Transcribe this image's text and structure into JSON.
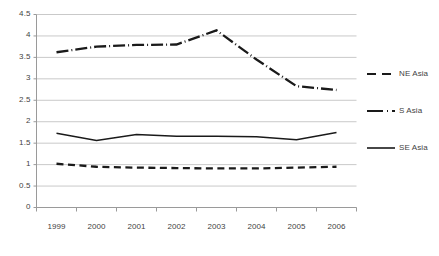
{
  "chart_data": {
    "type": "line",
    "title": "",
    "subtitle": "",
    "xlabel": "",
    "ylabel": "",
    "categories": [
      "1999",
      "2000",
      "2001",
      "2002",
      "2003",
      "2004",
      "2005",
      "2006"
    ],
    "ylim": [
      0,
      4.5
    ],
    "yticks": [
      "0",
      "0.5",
      "1",
      "1.5",
      "2",
      "2.5",
      "3",
      "3.5",
      "4",
      "4.5"
    ],
    "ytick_values": [
      0,
      0.5,
      1,
      1.5,
      2,
      2.5,
      3,
      3.5,
      4,
      4.5
    ],
    "grid": true,
    "grid_axis": "y",
    "legend_position": "right",
    "series": [
      {
        "name": "NE Asia",
        "style": "dashed",
        "color": "#1a1a1a",
        "values": [
          1.02,
          0.95,
          0.93,
          0.92,
          0.91,
          0.91,
          0.93,
          0.95
        ]
      },
      {
        "name": "S Asia",
        "style": "dash-dot",
        "color": "#1a1a1a",
        "values": [
          3.62,
          3.75,
          3.79,
          3.8,
          4.13,
          3.45,
          2.83,
          2.74
        ]
      },
      {
        "name": "SE Asia",
        "style": "solid",
        "color": "#1a1a1a",
        "values": [
          1.73,
          1.56,
          1.7,
          1.66,
          1.66,
          1.65,
          1.58,
          1.75
        ]
      }
    ]
  },
  "axes": {
    "ytick_labels": [
      "4.5",
      "4",
      "3.5",
      "3",
      "2.5",
      "2",
      "1.5",
      "1",
      "0.5",
      "0"
    ],
    "xtick_labels": [
      "1999",
      "2000",
      "2001",
      "2002",
      "2003",
      "2004",
      "2005",
      "2006"
    ]
  },
  "legend": {
    "items": [
      {
        "label": "NE Asia",
        "style": "dashed"
      },
      {
        "label": "S Asia",
        "style": "dash-dot"
      },
      {
        "label": "SE Asia",
        "style": "solid"
      }
    ]
  },
  "colors": {
    "line": "#1a1a1a",
    "grid": "#c9c9c9",
    "axis": "#9a9a9a",
    "text": "#3f3f3f",
    "background": "#ffffff"
  }
}
